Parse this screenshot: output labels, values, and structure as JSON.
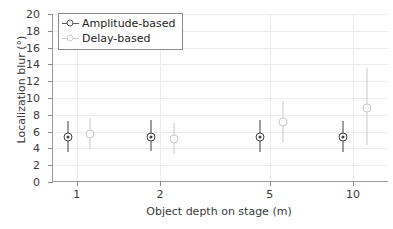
{
  "chart_data": {
    "type": "scatter",
    "title": "",
    "xlabel": "Object depth on stage (m)",
    "ylabel": "Localization blur (°)",
    "xscale": "log",
    "xlim": [
      0.82,
      13.5
    ],
    "ylim": [
      0,
      20
    ],
    "yticks": [
      0,
      2,
      4,
      6,
      8,
      10,
      12,
      14,
      16,
      18,
      20
    ],
    "xticks": [
      1,
      2,
      5,
      10
    ],
    "xtick_labels": [
      "1",
      "2",
      "5",
      "10"
    ],
    "grid": true,
    "legend_position": "upper-left",
    "series": [
      {
        "name": "Amplitude-based",
        "color": "#3f3f3f",
        "marker": "circle-dot",
        "x": [
          0.93,
          1.85,
          4.6,
          9.2
        ],
        "y": [
          5.3,
          5.4,
          5.4,
          5.3
        ],
        "yerr_low": [
          3.6,
          3.7,
          3.6,
          3.6
        ],
        "yerr_high": [
          7.3,
          7.4,
          7.4,
          7.3
        ]
      },
      {
        "name": "Delay-based",
        "color": "#c9c9c9",
        "marker": "circle-open",
        "x": [
          1.12,
          2.25,
          5.6,
          11.2
        ],
        "y": [
          5.7,
          5.1,
          7.1,
          8.8
        ],
        "yerr_low": [
          3.9,
          3.3,
          4.6,
          4.4
        ],
        "yerr_high": [
          7.6,
          7.0,
          9.7,
          13.6
        ]
      }
    ]
  },
  "legend": {
    "items": [
      {
        "label": "Amplitude-based",
        "color": "#5a5a5a"
      },
      {
        "label": "Delay-based",
        "color": "#cfcfcf"
      }
    ]
  }
}
